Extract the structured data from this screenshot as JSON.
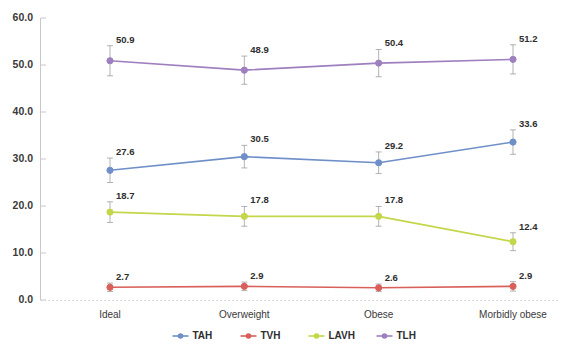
{
  "chart_data": {
    "type": "line",
    "title": "",
    "subtitle": "",
    "xlabel": "",
    "ylabel": "",
    "categories": [
      "Ideal",
      "Overweight",
      "Obese",
      "Morbidly obese"
    ],
    "ylim": [
      0.0,
      60.0
    ],
    "yticks": [
      "0.0",
      "10.0",
      "20.0",
      "30.0",
      "40.0",
      "50.0",
      "60.0"
    ],
    "ytick_values": [
      0.0,
      10.0,
      20.0,
      30.0,
      40.0,
      50.0,
      60.0
    ],
    "grid": false,
    "legend_position": "bottom",
    "error_bars": true,
    "series": [
      {
        "name": "TAH",
        "color": "#6f8fc9",
        "values": [
          27.6,
          30.5,
          29.2,
          33.6
        ],
        "labels": [
          "27.6",
          "30.5",
          "29.2",
          "33.6"
        ],
        "errors": [
          2.6,
          2.4,
          2.3,
          2.6
        ]
      },
      {
        "name": "TVH",
        "color": "#d9605a",
        "values": [
          2.7,
          2.9,
          2.6,
          2.9
        ],
        "labels": [
          "2.7",
          "2.9",
          "2.6",
          "2.9"
        ],
        "errors": [
          0.9,
          0.9,
          0.8,
          1.0
        ]
      },
      {
        "name": "LAVH",
        "color": "#c4d64a",
        "values": [
          18.7,
          17.8,
          17.8,
          12.4
        ],
        "labels": [
          "18.7",
          "17.8",
          "17.8",
          "12.4"
        ],
        "errors": [
          2.2,
          2.1,
          2.1,
          1.9
        ]
      },
      {
        "name": "TLH",
        "color": "#9e7fbf",
        "values": [
          50.9,
          48.9,
          50.4,
          51.2
        ],
        "labels": [
          "50.9",
          "48.9",
          "50.4",
          "51.2"
        ],
        "errors": [
          3.2,
          3.0,
          2.9,
          3.1
        ]
      }
    ],
    "legend": [
      {
        "label": "TAH",
        "color": "#6f8fc9"
      },
      {
        "label": "TVH",
        "color": "#d9605a"
      },
      {
        "label": "LAVH",
        "color": "#c4d64a"
      },
      {
        "label": "TLH",
        "color": "#9e7fbf"
      }
    ]
  }
}
